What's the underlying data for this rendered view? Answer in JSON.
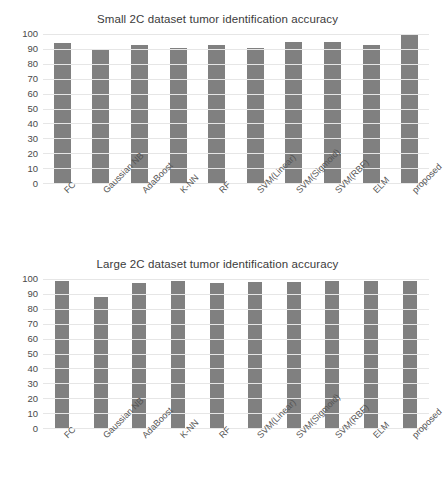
{
  "chart_data": [
    {
      "id": "small-2c",
      "type": "bar",
      "title": "Small 2C dataset tumor identification accuracy",
      "xlabel": "",
      "ylabel": "",
      "ylim": [
        0,
        100
      ],
      "yticks": [
        100,
        90,
        80,
        70,
        60,
        50,
        40,
        30,
        20,
        10,
        0
      ],
      "grid": true,
      "legend": "none",
      "bar_color": "#808080",
      "categories": [
        "FC",
        "Gaussian NB",
        "AdaBoost",
        "K-NN",
        "RF",
        "SVM(Linear)",
        "SVM(Sigmoid)",
        "SVM(RBF)",
        "ELM",
        "proposed"
      ],
      "values": [
        94.2,
        90.2,
        92.3,
        90.4,
        92.3,
        90.4,
        94.4,
        94.4,
        92.3,
        100.0
      ]
    },
    {
      "id": "large-2c",
      "type": "bar",
      "title": "Large 2C dataset tumor identification accuracy",
      "xlabel": "",
      "ylabel": "",
      "ylim": [
        0,
        100
      ],
      "yticks": [
        100,
        90,
        80,
        70,
        60,
        50,
        40,
        30,
        20,
        10,
        0
      ],
      "grid": true,
      "legend": "none",
      "bar_color": "#808080",
      "categories": [
        "FC",
        "Gaussian NB",
        "AdaBoost",
        "K-NN",
        "RF",
        "SVM(Linear)",
        "SVM(Sigmoid)",
        "SVM(RBF)",
        "ELM",
        "proposed"
      ],
      "values": [
        98.8,
        88.0,
        97.5,
        98.8,
        97.1,
        97.8,
        98.1,
        98.6,
        98.8,
        98.6
      ]
    }
  ]
}
